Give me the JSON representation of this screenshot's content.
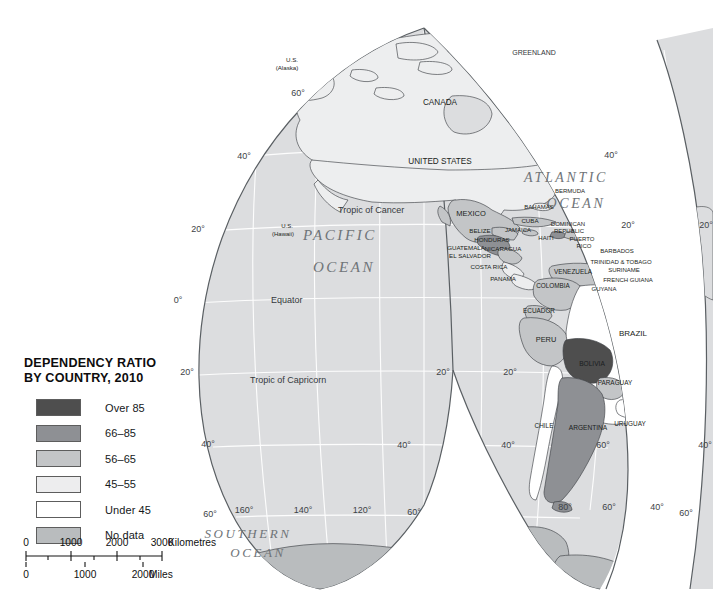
{
  "legend": {
    "title_line1": "DEPENDENCY RATIO",
    "title_line2": "BY COUNTRY, 2010",
    "items": [
      {
        "label": "Over 85",
        "color": "#4e4e4e"
      },
      {
        "label": "66–85",
        "color": "#8e9094"
      },
      {
        "label": "56–65",
        "color": "#c3c5c7"
      },
      {
        "label": "45–55",
        "color": "#ededee"
      },
      {
        "label": "Under 45",
        "color": "#ffffff"
      },
      {
        "label": "No data",
        "color": "#b9bcbe"
      }
    ]
  },
  "scale": {
    "km_ticks": [
      "0",
      "1000",
      "2000",
      "3000"
    ],
    "km_unit": "Kilometres",
    "mi_ticks": [
      "0",
      "1000",
      "2000"
    ],
    "mi_unit": "Miles"
  },
  "map": {
    "oceans": [
      "PACIFIC",
      "OCEAN",
      "ATLANTIC",
      "OCEAN",
      "SOUTHERN",
      "OCEAN"
    ],
    "ocean_labels": [
      {
        "text": "PACIFIC",
        "x": 340,
        "y": 240,
        "size": 15
      },
      {
        "text": "OCEAN",
        "x": 344,
        "y": 272,
        "size": 15
      },
      {
        "text": "ATLANTIC",
        "x": 566,
        "y": 182,
        "size": 14
      },
      {
        "text": "OCEAN",
        "x": 576,
        "y": 208,
        "size": 14
      },
      {
        "text": "SOUTHERN",
        "x": 248,
        "y": 538,
        "size": 13
      },
      {
        "text": "OCEAN",
        "x": 258,
        "y": 557,
        "size": 13
      }
    ],
    "graticule_labels": [
      {
        "text": "60°",
        "x": 298,
        "y": 96
      },
      {
        "text": "40°",
        "x": 244,
        "y": 159
      },
      {
        "text": "20°",
        "x": 198,
        "y": 232
      },
      {
        "text": "0°",
        "x": 178,
        "y": 303
      },
      {
        "text": "20°",
        "x": 187,
        "y": 375
      },
      {
        "text": "40°",
        "x": 208,
        "y": 447
      },
      {
        "text": "60°",
        "x": 210,
        "y": 517
      },
      {
        "text": "160°",
        "x": 244,
        "y": 513
      },
      {
        "text": "140°",
        "x": 303,
        "y": 513
      },
      {
        "text": "120°",
        "x": 362,
        "y": 513
      },
      {
        "text": "60°",
        "x": 414,
        "y": 515
      },
      {
        "text": "40°",
        "x": 611,
        "y": 158
      },
      {
        "text": "20°",
        "x": 628,
        "y": 228
      },
      {
        "text": "20°",
        "x": 443,
        "y": 375
      },
      {
        "text": "20°",
        "x": 510,
        "y": 375
      },
      {
        "text": "40°",
        "x": 404,
        "y": 448
      },
      {
        "text": "40°",
        "x": 508,
        "y": 448
      },
      {
        "text": "60°",
        "x": 603,
        "y": 448
      },
      {
        "text": "80°",
        "x": 565,
        "y": 510
      },
      {
        "text": "60°",
        "x": 609,
        "y": 510
      },
      {
        "text": "40°",
        "x": 657,
        "y": 510
      },
      {
        "text": "60°",
        "x": 686,
        "y": 516
      },
      {
        "text": "40°",
        "x": 705,
        "y": 448
      },
      {
        "text": "20°",
        "x": 706,
        "y": 228
      }
    ],
    "tropics": [
      {
        "text": "Tropic of Cancer",
        "x": 338,
        "y": 213
      },
      {
        "text": "Equator",
        "x": 271,
        "y": 303
      },
      {
        "text": "Tropic of Capricorn",
        "x": 250,
        "y": 383
      }
    ],
    "countries": [
      {
        "name": "GREENLAND",
        "x": 534,
        "y": 55,
        "size": 7.0,
        "cls": "ctryl"
      },
      {
        "name": "U.S.",
        "x": 292,
        "y": 62,
        "size": 6.2,
        "cls": "ctry"
      },
      {
        "name": "(Alaska)",
        "x": 287,
        "y": 70,
        "size": 6.2,
        "cls": "ctry"
      },
      {
        "name": "CANADA",
        "x": 440,
        "y": 105,
        "size": 8.2,
        "cls": "ctry"
      },
      {
        "name": "UNITED STATES",
        "x": 440,
        "y": 164,
        "size": 8.2,
        "cls": "ctry"
      },
      {
        "name": "MEXICO",
        "x": 471,
        "y": 216,
        "size": 7.5,
        "cls": "ctry"
      },
      {
        "name": "U.S.",
        "x": 287,
        "y": 228,
        "size": 6.0,
        "cls": "ctry"
      },
      {
        "name": "(Hawaii)",
        "x": 283,
        "y": 236,
        "size": 6.0,
        "cls": "ctry"
      },
      {
        "name": "BERMUDA",
        "x": 570,
        "y": 193,
        "size": 6.0,
        "cls": "ctry"
      },
      {
        "name": "BAHAMAS",
        "x": 539,
        "y": 209,
        "size": 6.0,
        "cls": "ctry"
      },
      {
        "name": "CUBA",
        "x": 530,
        "y": 223,
        "size": 6.2,
        "cls": "ctry"
      },
      {
        "name": "JAMAICA",
        "x": 518,
        "y": 232,
        "size": 6.0,
        "cls": "ctry"
      },
      {
        "name": "HAITI",
        "x": 546,
        "y": 240,
        "size": 6.0,
        "cls": "ctry"
      },
      {
        "name": "DOMINICAN",
        "x": 568,
        "y": 226,
        "size": 6.0,
        "cls": "ctry"
      },
      {
        "name": "REPUBLIC",
        "x": 569,
        "y": 233,
        "size": 6.0,
        "cls": "ctry"
      },
      {
        "name": "PUERTO",
        "x": 582,
        "y": 241,
        "size": 6.0,
        "cls": "ctry"
      },
      {
        "name": "RICO",
        "x": 584,
        "y": 248,
        "size": 6.0,
        "cls": "ctry"
      },
      {
        "name": "BELIZE",
        "x": 480,
        "y": 233,
        "size": 6.2,
        "cls": "ctry"
      },
      {
        "name": "HONDURAS",
        "x": 492,
        "y": 242,
        "size": 6.2,
        "cls": "ctry"
      },
      {
        "name": "GUATEMALA",
        "x": 466,
        "y": 250,
        "size": 6.2,
        "cls": "ctry"
      },
      {
        "name": "NICARAGUA",
        "x": 503,
        "y": 251,
        "size": 6.2,
        "cls": "ctry"
      },
      {
        "name": "EL SALVADOR",
        "x": 470,
        "y": 258,
        "size": 6.2,
        "cls": "ctry"
      },
      {
        "name": "COSTA RICA",
        "x": 489,
        "y": 269,
        "size": 6.2,
        "cls": "ctry"
      },
      {
        "name": "PANAMA",
        "x": 503,
        "y": 281,
        "size": 6.2,
        "cls": "ctry"
      },
      {
        "name": "BARBADOS",
        "x": 617,
        "y": 253,
        "size": 6.0,
        "cls": "ctry"
      },
      {
        "name": "TRINIDAD & TOBAGO",
        "x": 621,
        "y": 264,
        "size": 6.0,
        "cls": "ctry"
      },
      {
        "name": "VENEZUELA",
        "x": 573,
        "y": 274,
        "size": 6.4,
        "cls": "ctry"
      },
      {
        "name": "SURINAME",
        "x": 624,
        "y": 272,
        "size": 6.0,
        "cls": "ctry"
      },
      {
        "name": "FRENCH GUIANA",
        "x": 628,
        "y": 282,
        "size": 6.0,
        "cls": "ctry"
      },
      {
        "name": "COLOMBIA",
        "x": 553,
        "y": 288,
        "size": 6.4,
        "cls": "ctry"
      },
      {
        "name": "GUYANA",
        "x": 604,
        "y": 291,
        "size": 6.0,
        "cls": "ctry"
      },
      {
        "name": "ECUADOR",
        "x": 539,
        "y": 313,
        "size": 6.4,
        "cls": "ctry"
      },
      {
        "name": "BRAZIL",
        "x": 633,
        "y": 336,
        "size": 8.0,
        "cls": "ctry"
      },
      {
        "name": "PERU",
        "x": 546,
        "y": 342,
        "size": 7.4,
        "cls": "ctry"
      },
      {
        "name": "BOLIVIA",
        "x": 592,
        "y": 366,
        "size": 6.6,
        "cls": "ctry"
      },
      {
        "name": "PARAGUAY",
        "x": 615,
        "y": 385,
        "size": 6.4,
        "cls": "ctry"
      },
      {
        "name": "CHILE",
        "x": 544,
        "y": 428,
        "size": 6.4,
        "cls": "ctry"
      },
      {
        "name": "ARGENTINA",
        "x": 588,
        "y": 430,
        "size": 6.6,
        "cls": "ctry"
      },
      {
        "name": "URUGUAY",
        "x": 630,
        "y": 426,
        "size": 6.4,
        "cls": "ctry"
      }
    ]
  }
}
